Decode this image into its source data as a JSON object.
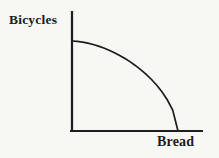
{
  "figure": {
    "kind": "production-possibilities-frontier",
    "background_color": "#f7f7f4",
    "ink_color": "#1d1d1f"
  },
  "chart_data": {
    "type": "line",
    "title": "",
    "xlabel": "Bread",
    "ylabel": "Bicycles",
    "xlim": [
      0,
      1
    ],
    "ylim": [
      0,
      1
    ],
    "grid": false,
    "legend": false,
    "series": [
      {
        "name": "frontier",
        "x": [
          0,
          0.05,
          0.1,
          0.15,
          0.2,
          0.25,
          0.3,
          0.35,
          0.4,
          0.45,
          0.5,
          0.55,
          0.6,
          0.65,
          0.7,
          0.75,
          0.8,
          0.85,
          0.9,
          0.95,
          1.0
        ],
        "y": [
          1,
          0.996,
          0.988,
          0.976,
          0.961,
          0.943,
          0.922,
          0.898,
          0.87,
          0.84,
          0.805,
          0.768,
          0.726,
          0.68,
          0.629,
          0.572,
          0.508,
          0.433,
          0.345,
          0.232,
          0
        ]
      }
    ]
  }
}
